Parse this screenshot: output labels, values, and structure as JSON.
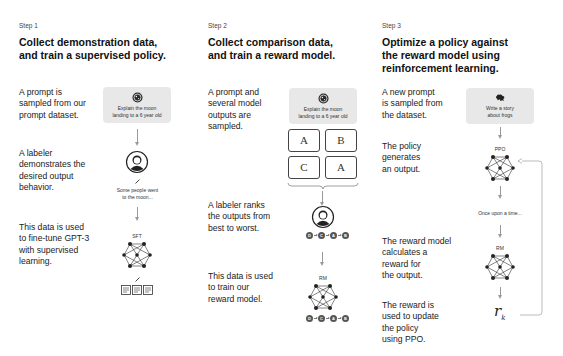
{
  "steps": [
    {
      "label": "Step 1",
      "title_line1": "Collect demonstration data,",
      "title_line2": "and train a supervised policy.",
      "descriptions": [
        [
          "A prompt is",
          "sampled from our",
          "prompt dataset."
        ],
        [
          "A labeler",
          "demonstrates the",
          "desired output",
          "behavior."
        ],
        [
          "This data is used",
          "to fine-tune GPT-3",
          "with supervised",
          "learning."
        ]
      ],
      "prompt": [
        "Explain the moon",
        "landing to a 6 year old"
      ],
      "demo_output": [
        "Some people went",
        "to the moon..."
      ],
      "model_label": "SFT"
    },
    {
      "label": "Step 2",
      "title_line1": "Collect comparison data,",
      "title_line2": "and train a reward model.",
      "descriptions": [
        [
          "A prompt and",
          "several model",
          "outputs are",
          "sampled."
        ],
        [
          "A labeler ranks",
          "the outputs from",
          "best to worst."
        ],
        [
          "This data is used",
          "to train our",
          "reward model."
        ]
      ],
      "prompt": [
        "Explain the moon",
        "landing to a 6 year old"
      ],
      "outputs": [
        "A",
        "B",
        "C",
        "A"
      ],
      "ranking": [
        "D",
        "C",
        "A",
        "B"
      ],
      "model_label": "RM"
    },
    {
      "label": "Step 3",
      "title_line1": "Optimize a policy against",
      "title_line2": "the reward model using",
      "title_line3": "reinforcement learning.",
      "descriptions": [
        [
          "A new prompt",
          "is sampled from",
          "the dataset."
        ],
        [
          "The policy",
          "generates",
          "an output."
        ],
        [
          "The reward model",
          "calculates a",
          "reward for",
          "the output."
        ],
        [
          "The reward is",
          "used to update",
          "the policy",
          "using PPO."
        ]
      ],
      "prompt": [
        "Write a story",
        "about frogs"
      ],
      "policy_label": "PPO",
      "generated_output": "Once upon a time...",
      "model_label": "RM",
      "reward_symbol": "r",
      "reward_subscript": "k"
    }
  ]
}
